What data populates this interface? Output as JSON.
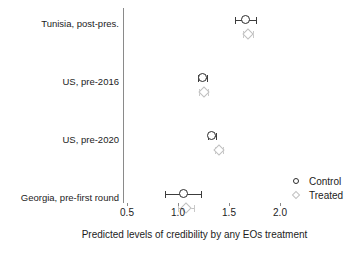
{
  "chart_data": {
    "type": "scatter",
    "title": "",
    "xlabel": "Predicted levels of credibility by any EOs treatment",
    "ylabel": "",
    "xlim": [
      0.38,
      2.12
    ],
    "xticks": [
      0.5,
      1.0,
      1.5,
      2.0
    ],
    "xtick_labels": [
      "0.5",
      "1.0",
      "1.5",
      "2.0"
    ],
    "grid": false,
    "orientation": "horizontal",
    "legend_position": "lower-right",
    "categories": [
      "Tunisia, post-pres.",
      "US, pre-2016",
      "US, pre-2020",
      "Georgia, pre-first round"
    ],
    "series": [
      {
        "name": "Control",
        "marker": "open-circle",
        "color": "#2b2b2b",
        "values": [
          1.66,
          1.24,
          1.33,
          1.05
        ],
        "ci_low": [
          1.56,
          1.2,
          1.29,
          0.87
        ],
        "ci_high": [
          1.76,
          1.28,
          1.37,
          1.23
        ]
      },
      {
        "name": "Treated",
        "marker": "open-diamond",
        "color": "#c0c0c0",
        "values": [
          1.69,
          1.25,
          1.4,
          1.08
        ],
        "ci_low": [
          1.64,
          1.21,
          1.36,
          1.0
        ],
        "ci_high": [
          1.74,
          1.29,
          1.44,
          1.16
        ]
      }
    ]
  },
  "legend": {
    "entries": [
      {
        "label": "Control",
        "marker": "open-circle"
      },
      {
        "label": "Treated",
        "marker": "open-diamond"
      }
    ]
  }
}
